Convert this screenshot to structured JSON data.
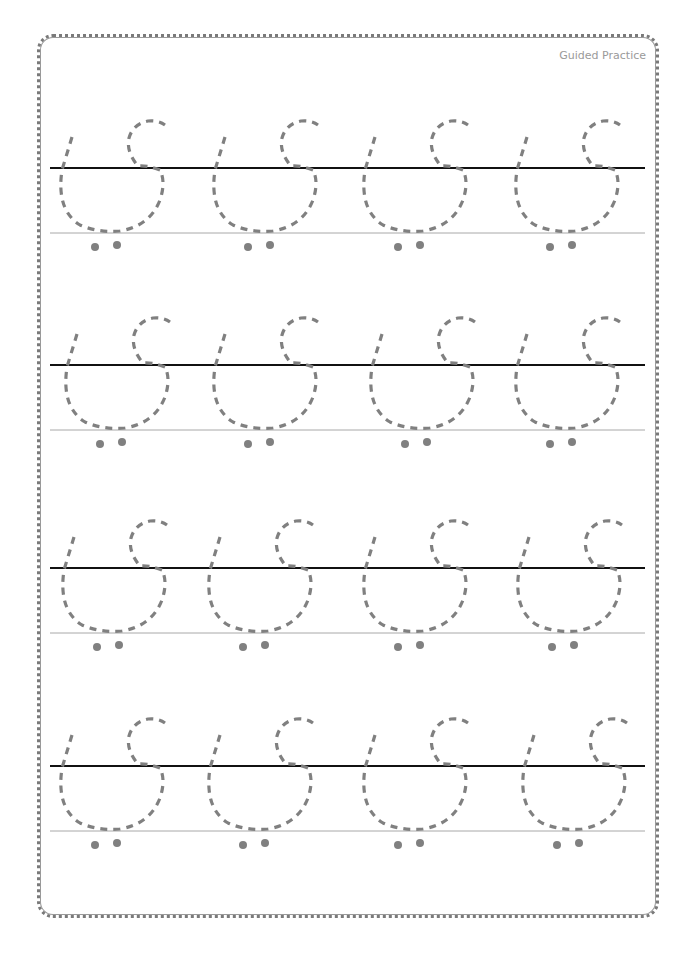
{
  "header": {
    "title": "Guided Practice"
  },
  "worksheet": {
    "glyph": "dashed tracing letter (Thai-like script)",
    "columns": 4,
    "rows": 4,
    "colors": {
      "border": "#7a7a7a",
      "baseline_dark": "#111111",
      "baseline_light": "#a8a8a8",
      "tracing_stroke": "#808080",
      "dots": "#808080"
    },
    "row_lines": [
      {
        "dark_y": 168,
        "light_y": 233
      },
      {
        "dark_y": 365,
        "light_y": 430
      },
      {
        "dark_y": 568,
        "light_y": 633
      },
      {
        "dark_y": 766,
        "light_y": 831
      }
    ],
    "glyph_offsets_x": [
      0,
      153,
      303,
      455
    ]
  }
}
